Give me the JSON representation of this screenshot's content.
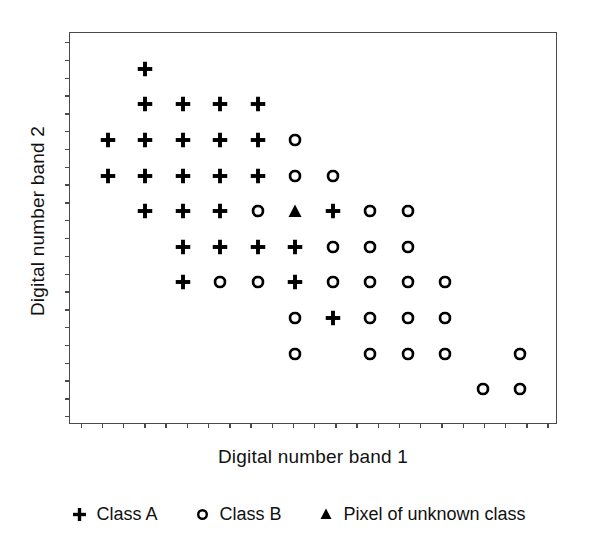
{
  "chart_data": {
    "type": "scatter",
    "title": "",
    "xlabel": "Digital number band 1",
    "ylabel": "Digital number band 2",
    "xlim": [
      0,
      13
    ],
    "ylim": [
      0,
      11
    ],
    "grid": false,
    "axis_tick_labels": {
      "x": [],
      "y": []
    },
    "x_tick_count": 23,
    "y_tick_count": 22,
    "legend_position": "below-plot",
    "series": [
      {
        "name": "Class A",
        "marker": "plus",
        "color": "#000000",
        "points": [
          {
            "x": 2,
            "y": 10
          },
          {
            "x": 2,
            "y": 9
          },
          {
            "x": 3,
            "y": 9
          },
          {
            "x": 4,
            "y": 9
          },
          {
            "x": 5,
            "y": 9
          },
          {
            "x": 1,
            "y": 8
          },
          {
            "x": 2,
            "y": 8
          },
          {
            "x": 3,
            "y": 8
          },
          {
            "x": 4,
            "y": 8
          },
          {
            "x": 5,
            "y": 8
          },
          {
            "x": 1,
            "y": 7
          },
          {
            "x": 2,
            "y": 7
          },
          {
            "x": 3,
            "y": 7
          },
          {
            "x": 4,
            "y": 7
          },
          {
            "x": 5,
            "y": 7
          },
          {
            "x": 2,
            "y": 6
          },
          {
            "x": 3,
            "y": 6
          },
          {
            "x": 4,
            "y": 6
          },
          {
            "x": 7,
            "y": 6
          },
          {
            "x": 3,
            "y": 5
          },
          {
            "x": 4,
            "y": 5
          },
          {
            "x": 5,
            "y": 5
          },
          {
            "x": 6,
            "y": 5
          },
          {
            "x": 3,
            "y": 4
          },
          {
            "x": 6,
            "y": 4
          },
          {
            "x": 7,
            "y": 3
          }
        ]
      },
      {
        "name": "Class B",
        "marker": "circle",
        "color": "#000000",
        "points": [
          {
            "x": 6,
            "y": 8
          },
          {
            "x": 6,
            "y": 7
          },
          {
            "x": 7,
            "y": 7
          },
          {
            "x": 5,
            "y": 6
          },
          {
            "x": 8,
            "y": 6
          },
          {
            "x": 9,
            "y": 6
          },
          {
            "x": 7,
            "y": 5
          },
          {
            "x": 8,
            "y": 5
          },
          {
            "x": 9,
            "y": 5
          },
          {
            "x": 4,
            "y": 4
          },
          {
            "x": 5,
            "y": 4
          },
          {
            "x": 7,
            "y": 4
          },
          {
            "x": 8,
            "y": 4
          },
          {
            "x": 9,
            "y": 4
          },
          {
            "x": 10,
            "y": 4
          },
          {
            "x": 6,
            "y": 3
          },
          {
            "x": 8,
            "y": 3
          },
          {
            "x": 9,
            "y": 3
          },
          {
            "x": 10,
            "y": 3
          },
          {
            "x": 6,
            "y": 2
          },
          {
            "x": 8,
            "y": 2
          },
          {
            "x": 9,
            "y": 2
          },
          {
            "x": 10,
            "y": 2
          },
          {
            "x": 12,
            "y": 2
          },
          {
            "x": 11,
            "y": 1
          },
          {
            "x": 12,
            "y": 1
          }
        ]
      },
      {
        "name": "Pixel of unknown class",
        "marker": "triangle",
        "color": "#000000",
        "points": [
          {
            "x": 6,
            "y": 6
          }
        ]
      }
    ]
  },
  "axes": {
    "x_title": "Digital number band 1",
    "y_title": "Digital number band 2"
  },
  "legend": {
    "items": [
      {
        "glyph": "plus-icon",
        "label": "Class A"
      },
      {
        "glyph": "circle-icon",
        "label": "Class B"
      },
      {
        "glyph": "triangle-icon",
        "label": "Pixel of unknown class"
      }
    ]
  },
  "style": {
    "marker_color": "#000000",
    "frame_color": "#4a4a4a",
    "background": "#ffffff"
  }
}
